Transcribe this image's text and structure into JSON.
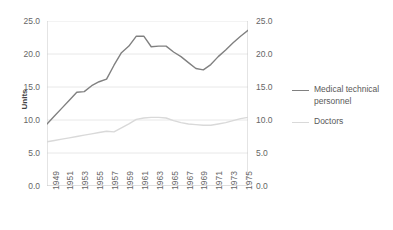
{
  "chart_data": {
    "type": "line",
    "title": "",
    "xlabel": "",
    "ylabel": "Units",
    "ylim": [
      0.0,
      25.0
    ],
    "y_ticks": [
      "0.0",
      "5.0",
      "10.0",
      "15.0",
      "20.0",
      "25.0"
    ],
    "y_tick_values": [
      0.0,
      5.0,
      10.0,
      15.0,
      20.0,
      25.0
    ],
    "secondary_y_axis": true,
    "secondary_y_ticks": [
      "0.0",
      "5.0",
      "10.0",
      "15.0",
      "20.0",
      "25.0"
    ],
    "grid": true,
    "legend_position": "right",
    "x": [
      1949,
      1950,
      1951,
      1952,
      1953,
      1954,
      1955,
      1956,
      1957,
      1958,
      1959,
      1960,
      1961,
      1962,
      1963,
      1964,
      1965,
      1966,
      1967,
      1968,
      1969,
      1970,
      1971,
      1972,
      1973,
      1974,
      1975,
      1976
    ],
    "x_tick_labels": [
      "1949",
      "1951",
      "1953",
      "1955",
      "1957",
      "1959",
      "1961",
      "1963",
      "1965",
      "1967",
      "1969",
      "1971",
      "1973",
      "1975"
    ],
    "series": [
      {
        "name": "Medical technical personnel",
        "color": "#808080",
        "values": [
          9.4,
          10.6,
          11.8,
          13.0,
          14.2,
          14.3,
          15.2,
          15.8,
          16.2,
          18.3,
          20.2,
          21.2,
          22.7,
          22.7,
          21.1,
          21.2,
          21.2,
          20.3,
          19.6,
          18.7,
          17.8,
          17.6,
          18.4,
          19.6,
          20.6,
          21.7,
          22.7,
          23.6
        ]
      },
      {
        "name": "Doctors",
        "color": "#d9d9d9",
        "values": [
          6.7,
          6.9,
          7.1,
          7.3,
          7.5,
          7.7,
          7.9,
          8.1,
          8.3,
          8.2,
          8.8,
          9.4,
          10.1,
          10.3,
          10.4,
          10.4,
          10.3,
          9.9,
          9.6,
          9.4,
          9.3,
          9.2,
          9.2,
          9.4,
          9.6,
          9.9,
          10.2,
          10.4
        ]
      }
    ]
  },
  "legend": {
    "items": [
      {
        "label": "Medical technical personnel"
      },
      {
        "label": "Doctors"
      }
    ]
  }
}
